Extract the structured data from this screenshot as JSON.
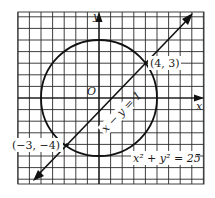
{
  "diagram": {
    "type": "coordinate-graph",
    "grid": {
      "x_min": -7,
      "x_max": 9,
      "y_min": -7,
      "y_max": 7,
      "unit": 1
    },
    "axes": {
      "x_label": "x",
      "y_label": "y",
      "origin_label": "O"
    },
    "circle": {
      "equation": "x² + y² = 25",
      "center": [
        0,
        0
      ],
      "radius": 5
    },
    "line": {
      "equation": "x − y = 1",
      "slope": 1,
      "intercept": -1
    },
    "intersections": [
      {
        "label": "(4, 3)",
        "x": 4,
        "y": 3
      },
      {
        "label": "(−3, −4)",
        "x": -3,
        "y": -4
      }
    ]
  }
}
